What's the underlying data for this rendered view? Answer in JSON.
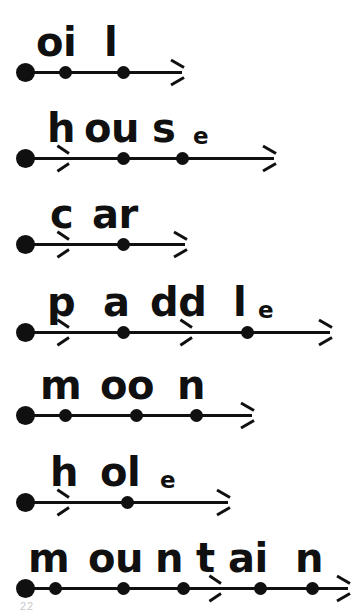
{
  "page": {
    "kind": "phonics-segmentation-worksheet",
    "background_color": "#ffffff",
    "ink_color": "#101010",
    "artifact_label": "22"
  },
  "rows": [
    {
      "word": "oil",
      "graphemes": [
        {
          "text": "oi",
          "x": 36,
          "silent": false
        },
        {
          "text": "l",
          "x": 104,
          "silent": false
        }
      ],
      "letters_baseline_y": 62,
      "line_y": 63,
      "line": {
        "start_x": 25,
        "end_x": 182,
        "start_dot": 25,
        "dots": [
          65,
          123
        ],
        "mid_arrows": [],
        "end_arrow": true
      }
    },
    {
      "word": "house",
      "graphemes": [
        {
          "text": "h",
          "x": 47,
          "silent": false
        },
        {
          "text": "ou",
          "x": 84,
          "silent": false
        },
        {
          "text": "s",
          "x": 152,
          "silent": false
        },
        {
          "text": "e",
          "x": 193,
          "silent": true
        }
      ],
      "letters_baseline_y": 148,
      "line_y": 149,
      "line": {
        "start_x": 25,
        "end_x": 274,
        "start_dot": 25,
        "dots": [
          123,
          182
        ],
        "mid_arrows": [
          66
        ],
        "end_arrow": true
      }
    },
    {
      "word": "car",
      "graphemes": [
        {
          "text": "c",
          "x": 50,
          "silent": false
        },
        {
          "text": "ar",
          "x": 92,
          "silent": false
        }
      ],
      "letters_baseline_y": 234,
      "line_y": 235,
      "line": {
        "start_x": 25,
        "end_x": 185,
        "start_dot": 25,
        "dots": [
          123
        ],
        "mid_arrows": [
          66
        ],
        "end_arrow": true
      }
    },
    {
      "word": "paddle",
      "graphemes": [
        {
          "text": "p",
          "x": 47,
          "silent": false
        },
        {
          "text": "a",
          "x": 103,
          "silent": false
        },
        {
          "text": "dd",
          "x": 150,
          "silent": false
        },
        {
          "text": "l",
          "x": 233,
          "silent": false
        },
        {
          "text": "e",
          "x": 258,
          "silent": true
        }
      ],
      "letters_baseline_y": 322,
      "line_y": 323,
      "line": {
        "start_x": 25,
        "end_x": 330,
        "start_dot": 25,
        "dots": [
          123,
          247
        ],
        "mid_arrows": [
          66,
          189
        ],
        "end_arrow": true
      }
    },
    {
      "word": "moon",
      "graphemes": [
        {
          "text": "m",
          "x": 40,
          "silent": false
        },
        {
          "text": "oo",
          "x": 100,
          "silent": false
        },
        {
          "text": "n",
          "x": 177,
          "silent": false
        }
      ],
      "letters_baseline_y": 405,
      "line_y": 406,
      "line": {
        "start_x": 25,
        "end_x": 252,
        "start_dot": 25,
        "dots": [
          65,
          136,
          196
        ],
        "mid_arrows": [],
        "end_arrow": true
      }
    },
    {
      "word": "hole",
      "graphemes": [
        {
          "text": "h",
          "x": 50,
          "silent": false
        },
        {
          "text": "ol",
          "x": 100,
          "silent": false
        },
        {
          "text": "e",
          "x": 160,
          "silent": true
        }
      ],
      "letters_baseline_y": 492,
      "line_y": 493,
      "line": {
        "start_x": 25,
        "end_x": 228,
        "start_dot": 25,
        "dots": [
          127
        ],
        "mid_arrows": [
          66
        ],
        "end_arrow": true
      }
    },
    {
      "word": "mountain",
      "graphemes": [
        {
          "text": "m",
          "x": 28,
          "silent": false
        },
        {
          "text": "ou",
          "x": 88,
          "silent": false
        },
        {
          "text": "n",
          "x": 155,
          "silent": false
        },
        {
          "text": "t",
          "x": 196,
          "silent": false
        },
        {
          "text": "ai",
          "x": 228,
          "silent": false
        },
        {
          "text": "n",
          "x": 295,
          "silent": false
        }
      ],
      "letters_baseline_y": 578,
      "line_y": 579,
      "line": {
        "start_x": 25,
        "end_x": 348,
        "start_dot": 25,
        "dots": [
          55,
          123,
          183,
          260,
          312
        ],
        "mid_arrows": [
          218
        ],
        "end_arrow": true
      }
    }
  ]
}
